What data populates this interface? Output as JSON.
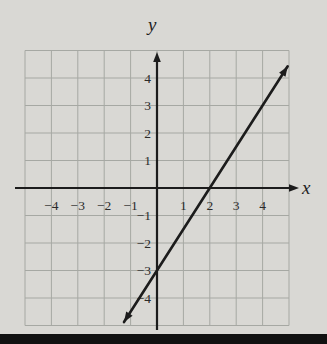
{
  "page": {
    "background": "#d9d8d4",
    "bottom_rule_color": "#111111"
  },
  "chart_data": {
    "type": "line",
    "title": "",
    "xlabel": "x",
    "ylabel": "y",
    "xlim": [
      -5,
      5
    ],
    "ylim": [
      -5,
      5
    ],
    "x_ticks": [
      -4,
      -3,
      -2,
      -1,
      1,
      2,
      3,
      4
    ],
    "y_ticks": [
      -4,
      -3,
      -2,
      -1,
      1,
      2,
      3,
      4
    ],
    "grid": true,
    "grid_color": "#a6a8a3",
    "axis_color": "#1c1c1c",
    "label_color": "#2b2b2b",
    "axes_have_arrows": [
      "x-positive",
      "y-positive"
    ],
    "series": [
      {
        "name": "line-y-equals-3-halves-x-minus-3",
        "equation": "y = (3/2)x - 3",
        "slope": 1.5,
        "y_intercept": -3,
        "x_intercept": 2,
        "points": [
          [
            0,
            -3
          ],
          [
            2,
            0
          ]
        ],
        "draw_from_x": -1.25,
        "draw_to_x": 4.95,
        "arrow_both_ends": true,
        "color": "#1c1c1c"
      }
    ]
  }
}
